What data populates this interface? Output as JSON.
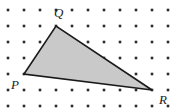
{
  "figure": {
    "name": "lattice-triangle-figure",
    "width": 179,
    "height": 112,
    "background_color": "#ffffff"
  },
  "grid": {
    "type": "dot-lattice",
    "columns": 11,
    "rows": 7,
    "spacing_px": 16,
    "origin_x": 8,
    "origin_y": 10,
    "dot_size_px": 2.6,
    "dot_color": "#2b2b2b"
  },
  "shape": {
    "type": "triangle",
    "fill_color": "#c9c9c9",
    "stroke_color": "#1a1a1a",
    "stroke_width": 1.6,
    "points_px": "24,74 56,26 152,90",
    "vertices": [
      {
        "label": "P",
        "x_px": 24,
        "y_px": 74,
        "lattice_x": 1,
        "lattice_y": 4,
        "label_x_px": 11,
        "label_y_px": 78
      },
      {
        "label": "Q",
        "x_px": 56,
        "y_px": 26,
        "lattice_x": 3,
        "lattice_y": 1,
        "label_x_px": 54,
        "label_y_px": 6
      },
      {
        "label": "R",
        "x_px": 152,
        "y_px": 90,
        "lattice_x": 9,
        "lattice_y": 5,
        "label_x_px": 159,
        "label_y_px": 93
      }
    ]
  }
}
